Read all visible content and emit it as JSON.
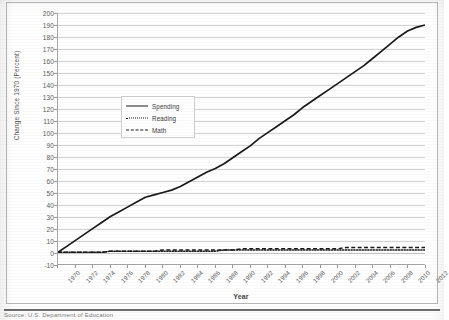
{
  "figure": {
    "caption_clipped": "Source: U.S. Department of Education"
  },
  "chart_data": {
    "type": "line",
    "title": "",
    "xlabel": "Year",
    "ylabel": "Change Since 1970 (Percent)",
    "xlim": [
      1970,
      2012
    ],
    "ylim": [
      -10,
      200
    ],
    "ytick_step": 10,
    "xtick_step": 2,
    "grid": true,
    "legend_position": "upper-left-center",
    "yticks": [
      200,
      190,
      180,
      170,
      160,
      150,
      140,
      130,
      120,
      110,
      100,
      90,
      80,
      70,
      60,
      50,
      40,
      30,
      20,
      10,
      0,
      -10
    ],
    "xticks": [
      1970,
      1972,
      1974,
      1976,
      1978,
      1980,
      1982,
      1984,
      1986,
      1988,
      1990,
      1992,
      1994,
      1996,
      1998,
      2000,
      2002,
      2004,
      2006,
      2008,
      2010,
      2012
    ],
    "x": [
      1970,
      1971,
      1972,
      1973,
      1974,
      1975,
      1976,
      1977,
      1978,
      1979,
      1980,
      1981,
      1982,
      1983,
      1984,
      1985,
      1986,
      1987,
      1988,
      1989,
      1990,
      1991,
      1992,
      1993,
      1994,
      1995,
      1996,
      1997,
      1998,
      1999,
      2000,
      2001,
      2002,
      2003,
      2004,
      2005,
      2006,
      2007,
      2008,
      2009,
      2010,
      2011,
      2012
    ],
    "series": [
      {
        "name": "Spending",
        "style": "solid",
        "color": "#1a1a1a",
        "values": [
          0,
          5,
          10,
          15,
          20,
          25,
          30,
          34,
          38,
          42,
          46,
          48,
          50,
          52,
          55,
          59,
          63,
          67,
          70,
          74,
          79,
          84,
          89,
          95,
          100,
          105,
          110,
          115,
          121,
          126,
          131,
          136,
          141,
          146,
          151,
          156,
          162,
          168,
          174,
          180,
          185,
          188,
          190
        ]
      },
      {
        "name": "Reading",
        "style": "dotted",
        "color": "#1a1a1a",
        "values": [
          0,
          0,
          0,
          0,
          0,
          0,
          1,
          1,
          1,
          1,
          1,
          1,
          1,
          1,
          1,
          1,
          1,
          1,
          1,
          2,
          2,
          2,
          2,
          2,
          2,
          2,
          2,
          2,
          2,
          2,
          2,
          2,
          2,
          2,
          2,
          2,
          2,
          2,
          2,
          2,
          2,
          2,
          2
        ]
      },
      {
        "name": "Math",
        "style": "dashed",
        "color": "#1a1a1a",
        "values": [
          0,
          0,
          0,
          0,
          0,
          0,
          1,
          1,
          1,
          1,
          1,
          1,
          2,
          2,
          2,
          2,
          2,
          2,
          2,
          2,
          2,
          3,
          3,
          3,
          3,
          3,
          3,
          3,
          3,
          3,
          3,
          3,
          3,
          4,
          4,
          4,
          4,
          4,
          4,
          4,
          4,
          4,
          4
        ]
      }
    ]
  }
}
